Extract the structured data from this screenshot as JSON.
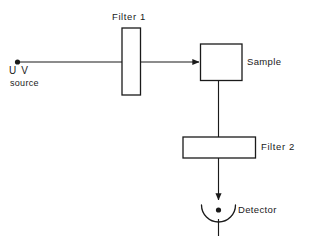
{
  "diagram": {
    "background_color": "#ffffff",
    "stroke_color": "#1a1a1a",
    "nodes": {
      "uv_source": {
        "kind": "point-source",
        "label_line1": "U V",
        "label_line2": "source",
        "dot_marker": "filled-circle"
      },
      "filter1": {
        "kind": "rectangle",
        "orientation": "vertical",
        "label": "Filter 1",
        "label_position": "above"
      },
      "sample": {
        "kind": "rectangle",
        "orientation": "square",
        "label": "Sample",
        "label_position": "right"
      },
      "filter2": {
        "kind": "rectangle",
        "orientation": "horizontal",
        "label": "Filter 2",
        "label_position": "right"
      },
      "detector": {
        "kind": "arc-cup-with-dot",
        "label": "Detector",
        "label_position": "right",
        "dot_marker": "filled-circle"
      }
    },
    "connections": [
      {
        "from": "uv_source",
        "to": "sample",
        "path": "horizontal",
        "through": "filter1",
        "arrow": "end"
      },
      {
        "from": "sample",
        "to": "filter2",
        "path": "vertical",
        "arrow": "none"
      },
      {
        "from": "filter2",
        "to": "detector",
        "path": "vertical",
        "arrow": "end"
      }
    ]
  }
}
